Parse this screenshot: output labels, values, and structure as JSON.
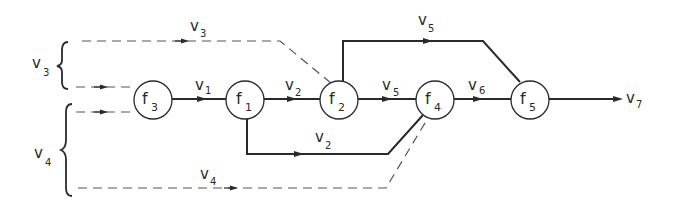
{
  "diagram": {
    "type": "flow-network",
    "nodes": [
      {
        "id": "f3",
        "name": "f",
        "sub": "3",
        "cx": 153,
        "cy": 100
      },
      {
        "id": "f1",
        "name": "f",
        "sub": "1",
        "cx": 245,
        "cy": 100
      },
      {
        "id": "f2",
        "name": "f",
        "sub": "2",
        "cx": 339,
        "cy": 100
      },
      {
        "id": "f4",
        "name": "f",
        "sub": "4",
        "cx": 435,
        "cy": 100
      },
      {
        "id": "f5",
        "name": "f",
        "sub": "5",
        "cx": 530,
        "cy": 100
      }
    ],
    "edges": [
      {
        "from": "f3",
        "to": "f1",
        "label": "v",
        "sub": "1",
        "style": "solid"
      },
      {
        "from": "f1",
        "to": "f2",
        "label": "v",
        "sub": "2",
        "style": "solid"
      },
      {
        "from": "f1",
        "to": "f4",
        "label": "v",
        "sub": "2",
        "style": "solid",
        "route": "below"
      },
      {
        "from": "f2",
        "to": "f4",
        "label": "v",
        "sub": "5",
        "style": "solid"
      },
      {
        "from": "f2",
        "to": "f5",
        "label": "v",
        "sub": "5",
        "style": "solid",
        "route": "above"
      },
      {
        "from": "f4",
        "to": "f5",
        "label": "v",
        "sub": "6",
        "style": "solid"
      },
      {
        "from": "f5",
        "to": "output",
        "label": "v",
        "sub": "7",
        "style": "solid"
      },
      {
        "from": "input-v3",
        "to": "f3",
        "style": "dashed"
      },
      {
        "from": "input-v3",
        "to": "f2",
        "label": "v",
        "sub": "3",
        "style": "dashed",
        "route": "above"
      },
      {
        "from": "input-v4",
        "to": "f3",
        "style": "dashed"
      },
      {
        "from": "input-v4",
        "to": "f4",
        "label": "v",
        "sub": "4",
        "style": "dashed",
        "route": "below"
      }
    ],
    "input_groups": [
      {
        "label": "v",
        "sub": "3"
      },
      {
        "label": "v",
        "sub": "4"
      }
    ],
    "colors": {
      "stroke": "#2a2a2a",
      "dashed": "#555555",
      "background": "#ffffff"
    }
  }
}
